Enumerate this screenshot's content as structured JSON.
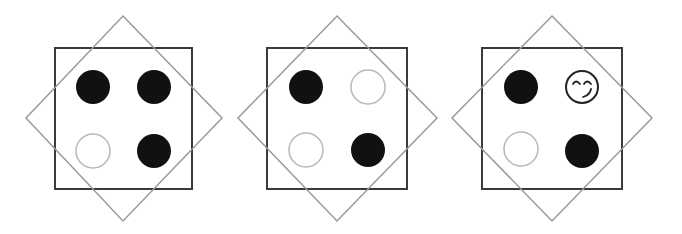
{
  "figure": {
    "colors": {
      "square_stroke": "#3a3a3a",
      "diamond_stroke": "#9a9a9a",
      "filled_circle": "#111111",
      "empty_circle_stroke": "#b8b8b8",
      "smiley_stroke": "#222222",
      "background": "#ffffff"
    },
    "panels": [
      {
        "id": "panel-1",
        "square": {
          "x": 55,
          "y": 48,
          "w": 137,
          "h": 141
        },
        "diamond": {
          "cx": 123,
          "top": 16,
          "bottom": 221,
          "left": 26,
          "right": 222,
          "cy": 118
        },
        "circles": [
          {
            "pos": "top-left",
            "cx": 93,
            "cy": 87,
            "r": 17,
            "state": "filled"
          },
          {
            "pos": "top-right",
            "cx": 154,
            "cy": 87,
            "r": 17,
            "state": "filled"
          },
          {
            "pos": "bottom-left",
            "cx": 93,
            "cy": 151,
            "r": 17,
            "state": "empty"
          },
          {
            "pos": "bottom-right",
            "cx": 154,
            "cy": 151,
            "r": 17,
            "state": "filled"
          }
        ]
      },
      {
        "id": "panel-2",
        "square": {
          "x": 267,
          "y": 48,
          "w": 140,
          "h": 141
        },
        "diamond": {
          "cx": 337,
          "top": 16,
          "bottom": 221,
          "left": 238,
          "right": 437,
          "cy": 118
        },
        "circles": [
          {
            "pos": "top-left",
            "cx": 306,
            "cy": 87,
            "r": 17,
            "state": "filled"
          },
          {
            "pos": "top-right",
            "cx": 368,
            "cy": 87,
            "r": 17,
            "state": "empty"
          },
          {
            "pos": "bottom-left",
            "cx": 306,
            "cy": 150,
            "r": 17,
            "state": "empty"
          },
          {
            "pos": "bottom-right",
            "cx": 368,
            "cy": 150,
            "r": 17,
            "state": "filled"
          }
        ]
      },
      {
        "id": "panel-3",
        "square": {
          "x": 482,
          "y": 48,
          "w": 140,
          "h": 141
        },
        "diamond": {
          "cx": 552,
          "top": 16,
          "bottom": 221,
          "left": 452,
          "right": 652,
          "cy": 118
        },
        "circles": [
          {
            "pos": "top-left",
            "cx": 521,
            "cy": 87,
            "r": 17,
            "state": "filled"
          },
          {
            "pos": "top-right",
            "cx": 582,
            "cy": 87,
            "r": 16,
            "state": "smiley"
          },
          {
            "pos": "bottom-left",
            "cx": 521,
            "cy": 149,
            "r": 17,
            "state": "empty"
          },
          {
            "pos": "bottom-right",
            "cx": 582,
            "cy": 151,
            "r": 17,
            "state": "filled"
          }
        ]
      }
    ]
  }
}
